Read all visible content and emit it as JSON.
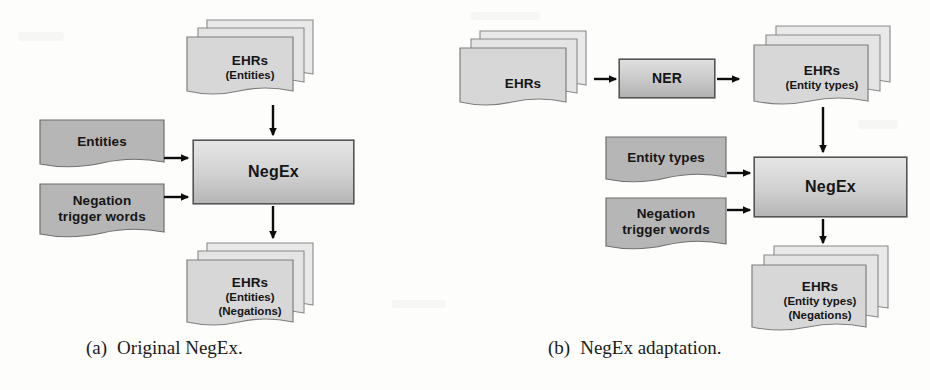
{
  "figure": {
    "type": "diagram",
    "background": "#fdfdfc",
    "panels": [
      {
        "id": "a",
        "caption_id": "(a)",
        "caption_text": "Original NegEx.",
        "nodes": [
          {
            "key": "ehr_in",
            "shape": "document-stack",
            "stack_count": 3,
            "fill": "#d8d8d8",
            "lines": [
              "EHRs",
              "(Entities)"
            ]
          },
          {
            "key": "entities",
            "shape": "document",
            "stack_count": 1,
            "fill": "#b4b4b4",
            "lines": [
              "Entities"
            ]
          },
          {
            "key": "triggers",
            "shape": "document",
            "stack_count": 1,
            "fill": "#b4b4b4",
            "lines": [
              "Negation",
              "trigger words"
            ]
          },
          {
            "key": "negex",
            "shape": "process-box",
            "fill_top": "#e2e2e2",
            "fill_bottom": "#b9b9b9",
            "lines": [
              "NegEx"
            ]
          },
          {
            "key": "ehr_out",
            "shape": "document-stack",
            "stack_count": 3,
            "fill": "#d8d8d8",
            "lines": [
              "EHRs",
              "(Entities)",
              "(Negations)"
            ]
          }
        ],
        "edges": [
          {
            "from": "ehr_in",
            "to": "negex",
            "direction": "down"
          },
          {
            "from": "entities",
            "to": "negex",
            "direction": "right"
          },
          {
            "from": "triggers",
            "to": "negex",
            "direction": "right"
          },
          {
            "from": "negex",
            "to": "ehr_out",
            "direction": "down"
          }
        ]
      },
      {
        "id": "b",
        "caption_id": "(b)",
        "caption_text": "NegEx adaptation.",
        "nodes": [
          {
            "key": "ehr_raw",
            "shape": "document-stack",
            "stack_count": 3,
            "fill": "#d8d8d8",
            "lines": [
              "EHRs"
            ]
          },
          {
            "key": "ner",
            "shape": "process-box",
            "fill_top": "#dcdcdc",
            "fill_bottom": "#b4b4b4",
            "lines": [
              "NER"
            ]
          },
          {
            "key": "ehr_typed",
            "shape": "document-stack",
            "stack_count": 3,
            "fill": "#d8d8d8",
            "lines": [
              "EHRs",
              "(Entity types)"
            ]
          },
          {
            "key": "entity_types",
            "shape": "document",
            "stack_count": 1,
            "fill": "#b4b4b4",
            "lines": [
              "Entity types"
            ]
          },
          {
            "key": "triggers_b",
            "shape": "document",
            "stack_count": 1,
            "fill": "#b4b4b4",
            "lines": [
              "Negation",
              "trigger words"
            ]
          },
          {
            "key": "negex_b",
            "shape": "process-box",
            "fill_top": "#e2e2e2",
            "fill_bottom": "#b9b9b9",
            "lines": [
              "NegEx"
            ]
          },
          {
            "key": "ehr_out_b",
            "shape": "document-stack",
            "stack_count": 3,
            "fill": "#d8d8d8",
            "lines": [
              "EHRs",
              "(Entity types)",
              "(Negations)"
            ]
          }
        ],
        "edges": [
          {
            "from": "ehr_raw",
            "to": "ner",
            "direction": "right"
          },
          {
            "from": "ner",
            "to": "ehr_typed",
            "direction": "right"
          },
          {
            "from": "ehr_typed",
            "to": "negex_b",
            "direction": "down"
          },
          {
            "from": "entity_types",
            "to": "negex_b",
            "direction": "right"
          },
          {
            "from": "triggers_b",
            "to": "negex_b",
            "direction": "right"
          },
          {
            "from": "negex_b",
            "to": "ehr_out_b",
            "direction": "down"
          }
        ]
      }
    ]
  },
  "labels": {
    "ehrs": "EHRs",
    "entities_paren": "(Entities)",
    "negations_paren": "(Negations)",
    "entity_types_paren": "(Entity types)",
    "entities": "Entities",
    "entity_types": "Entity types",
    "negation": "Negation",
    "trigger_words": "trigger words",
    "negex": "NegEx",
    "ner": "NER"
  },
  "captions": {
    "a_id": "(a)",
    "a_text": "Original NegEx.",
    "b_id": "(b)",
    "b_text": "NegEx adaptation."
  }
}
